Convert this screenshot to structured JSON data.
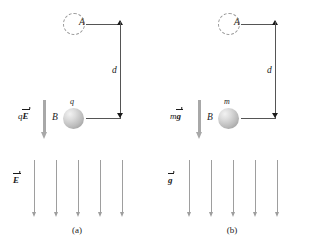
{
  "figure": {
    "background_color": "#ffffff",
    "field_arrow_color": "#9e9e9e",
    "force_arrow_color": "#a8a8a8",
    "sphere_color": "#bcbcbc",
    "line_color": "#555555",
    "text_color": "#1a1a1a"
  },
  "panel_a": {
    "caption": "(a)",
    "point_a_label": "A",
    "point_b_label": "B",
    "body_label": "q",
    "distance_label": "d",
    "force_label_prefix": "q",
    "force_label_vector": "E",
    "field_label_vector": "E",
    "field_arrow_count": 5
  },
  "panel_b": {
    "caption": "(b)",
    "point_a_label": "A",
    "point_b_label": "B",
    "body_label": "m",
    "distance_label": "d",
    "force_label_prefix": "m",
    "force_label_vector": "g",
    "field_label_vector": "g",
    "field_arrow_count": 5
  }
}
